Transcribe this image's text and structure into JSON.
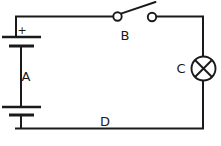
{
  "figure": {
    "width": 221,
    "height": 146,
    "background_color": "#ffffff",
    "line_color": "#1a1a1a"
  },
  "labels": {
    "battery": "A",
    "switch": "B",
    "lamp": "C",
    "wire": "D",
    "polarity_plus": "+"
  },
  "components": [
    {
      "id": "battery",
      "label": "A",
      "icon": "battery-cells-icon",
      "type": "battery",
      "position": "left-branch",
      "cells": 2,
      "polarity_marker": "+",
      "polarity_side": "top"
    },
    {
      "id": "switch",
      "label": "B",
      "icon": "open-switch-icon",
      "type": "switch",
      "position": "top-branch",
      "state": "open"
    },
    {
      "id": "lamp",
      "label": "C",
      "icon": "lamp-crossed-circle-icon",
      "type": "lamp",
      "position": "right-branch",
      "state": "off"
    },
    {
      "id": "wire",
      "label": "D",
      "icon": "wire-icon",
      "type": "conductor",
      "position": "bottom-branch"
    }
  ],
  "geometry": {
    "loop": {
      "left": 15,
      "right": 203,
      "top": 16,
      "bottom": 129
    },
    "battery": {
      "cell1_long_plate": {
        "x1": 2,
        "x2": 41,
        "y": 37
      },
      "cell1_short_plate": {
        "x1": 8,
        "x2": 34,
        "y": 46
      },
      "cell2_long_plate": {
        "x1": 2,
        "x2": 41,
        "y": 107
      },
      "cell2_short_plate": {
        "x1": 8,
        "x2": 34,
        "y": 115
      },
      "plus_pos": {
        "x": 22,
        "y": 34
      },
      "label_pos": {
        "x": 26,
        "y": 81
      }
    },
    "switch": {
      "left_terminal": {
        "cx": 117.5,
        "cy": 16.5,
        "r": 4.2
      },
      "right_terminal": {
        "cx": 152,
        "cy": 17,
        "r": 4.2
      },
      "lever": {
        "x1": 121,
        "y1": 14,
        "x2": 155,
        "y2": 2
      },
      "label_pos": {
        "x": 125,
        "y": 40
      }
    },
    "lamp": {
      "circle": {
        "cx": 203.5,
        "cy": 68.5,
        "r": 12
      },
      "label_pos": {
        "x": 177,
        "y": 73
      }
    },
    "wire_label_pos": {
      "x": 100,
      "y": 126
    }
  }
}
